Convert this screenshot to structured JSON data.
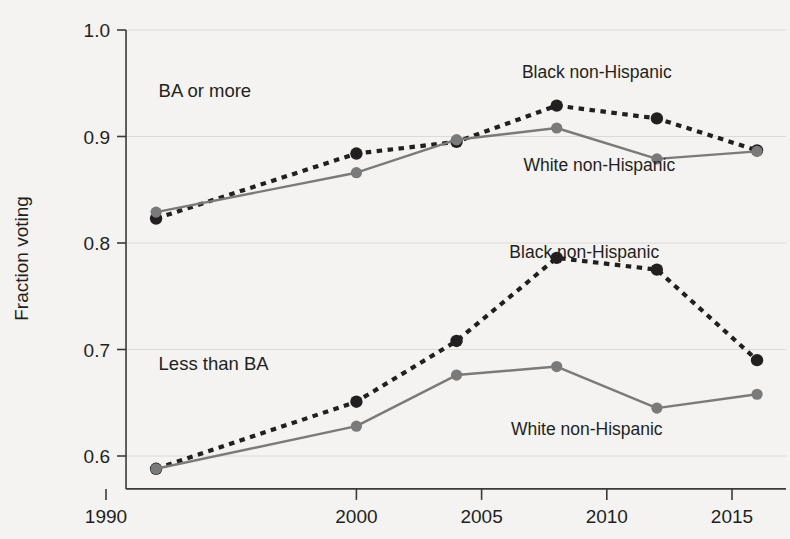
{
  "chart_data": {
    "type": "line",
    "title": "",
    "xlabel": "",
    "ylabel": "Fraction voting",
    "xlim": [
      1990.8,
      2017.3
    ],
    "ylim": [
      0.571,
      1.0
    ],
    "x": [
      1992,
      2000,
      2004,
      2008,
      2012,
      2016
    ],
    "xticks": [
      1990,
      2000,
      2005,
      2010,
      2015
    ],
    "xticklabels": [
      "1990",
      "2000",
      "2005",
      "2010",
      "2015"
    ],
    "yticks": [
      0.6,
      0.7,
      0.8,
      0.9,
      1.0
    ],
    "yticklabels": [
      "0.6",
      "0.7",
      "0.8",
      "0.9",
      "1.0"
    ],
    "grid": true,
    "legend_position": "inline-annotations",
    "groups": [
      {
        "name": "BA or more",
        "label": "BA or more",
        "label_x": 1992.1,
        "label_y": 0.937,
        "series": [
          {
            "name": "Black non-Hispanic",
            "style": "dotted",
            "color": "#231f20",
            "values": [
              0.823,
              0.884,
              0.895,
              0.929,
              0.917,
              0.887
            ],
            "annotation": "Black non-Hispanic",
            "annotation_x": 2009.6,
            "annotation_y": 0.955
          },
          {
            "name": "White non-Hispanic",
            "style": "solid",
            "color": "#7a7a7a",
            "values": [
              0.829,
              0.866,
              0.897,
              0.908,
              0.879,
              0.886
            ],
            "annotation": "White non-Hispanic",
            "annotation_x": 2009.7,
            "annotation_y": 0.868
          }
        ]
      },
      {
        "name": "Less than BA",
        "label": "Less than BA",
        "label_x": 1992.1,
        "label_y": 0.681,
        "series": [
          {
            "name": "Black non-Hispanic",
            "style": "dotted",
            "color": "#231f20",
            "values": [
              0.588,
              0.651,
              0.708,
              0.786,
              0.775,
              0.69
            ],
            "annotation": "Black non-Hispanic",
            "annotation_x": 2009.1,
            "annotation_y": 0.786
          },
          {
            "name": "White non-Hispanic",
            "style": "solid",
            "color": "#7a7a7a",
            "values": [
              0.588,
              0.628,
              0.676,
              0.684,
              0.645,
              0.658
            ],
            "annotation": "White non-Hispanic",
            "annotation_x": 2009.2,
            "annotation_y": 0.62
          }
        ]
      }
    ],
    "colors": {
      "black_series": "#231f20",
      "white_series": "#7a7a7a",
      "axis": "#3a3a3a",
      "grid": "#dcdad6",
      "background": "#f4f3f1"
    }
  }
}
